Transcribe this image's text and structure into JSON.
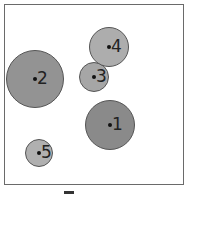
{
  "diagram": {
    "circles": [
      {
        "label": "1",
        "cx": 110,
        "cy": 125,
        "r": 25,
        "fill": "#8a8a8a"
      },
      {
        "label": "2",
        "cx": 35,
        "cy": 79,
        "r": 29,
        "fill": "#939393"
      },
      {
        "label": "3",
        "cx": 94,
        "cy": 77,
        "r": 15,
        "fill": "#a6a6a6"
      },
      {
        "label": "4",
        "cx": 109,
        "cy": 47,
        "r": 20,
        "fill": "#adadad"
      },
      {
        "label": "5",
        "cx": 39,
        "cy": 153,
        "r": 14,
        "fill": "#b0b0b0"
      }
    ]
  }
}
